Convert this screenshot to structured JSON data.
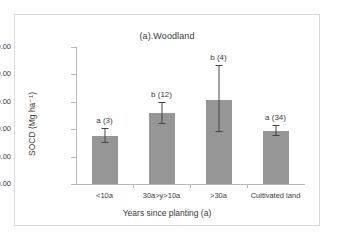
{
  "figure": {
    "title": "(a).Woodland",
    "background_color": "#ffffff",
    "frame_color": "#d8d8d8"
  },
  "chart_data": {
    "type": "bar",
    "title": "(a).Woodland",
    "xlabel": "Years since planting (a)",
    "ylabel": "SOCD (Mg ha⁻¹)",
    "categories": [
      "<10a",
      "30a>y>10a",
      ">30a",
      "Cultivated land"
    ],
    "values": [
      17.5,
      26.0,
      30.5,
      19.2
    ],
    "error_upper": [
      20.0,
      29.5,
      43.0,
      21.0
    ],
    "error_lower": [
      15.0,
      21.8,
      19.0,
      17.5
    ],
    "annotations": [
      "a (3)",
      "b (12)",
      "b (4)",
      "a (34)"
    ],
    "group_letters": [
      "a",
      "b",
      "b",
      "a"
    ],
    "sample_sizes": [
      3,
      12,
      4,
      34
    ],
    "ylim": [
      0,
      50
    ],
    "yticks": [
      0,
      10,
      20,
      30,
      40,
      50
    ],
    "ytick_labels": [
      "0.00",
      "10.00",
      "20.00",
      "30.00",
      "40.00",
      "50.00"
    ],
    "grid": false,
    "legend": "none",
    "bar_color": "#969696",
    "error_bar_color": "#444444",
    "axis_color": "#b9b9b9"
  }
}
